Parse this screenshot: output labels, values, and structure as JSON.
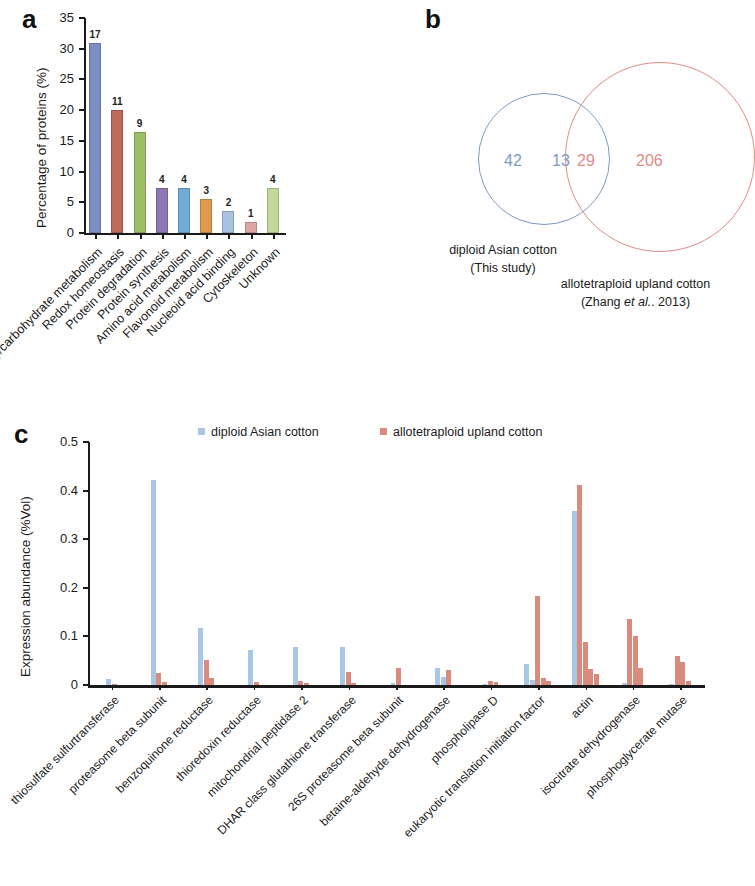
{
  "figure": {
    "panel_a_letter": "a",
    "panel_b_letter": "b",
    "panel_c_letter": "c"
  },
  "panel_a": {
    "ylabel": "Percentage of proteins (%)",
    "chart_data": {
      "type": "bar",
      "title": "",
      "xlabel": "",
      "ylabel": "Percentage of proteins (%)",
      "ylim": [
        0,
        35
      ],
      "yticks": [
        0,
        5,
        10,
        15,
        20,
        25,
        30,
        35
      ],
      "grid": false,
      "legend": "none",
      "categories": [
        "Energy/carbohydrate metabolism",
        "Redox homeostasis",
        "Protein degradation",
        "Protein synthesis",
        "Amino acid metabolism",
        "Flavonoid metabolism",
        "Nucleoid acid binding",
        "Cytoskeleton",
        "Unknown"
      ],
      "values": [
        30.9,
        20.0,
        16.4,
        7.3,
        7.3,
        5.5,
        3.6,
        1.8,
        7.3
      ],
      "counts": [
        17,
        11,
        9,
        4,
        4,
        3,
        2,
        1,
        4
      ],
      "bar_colors": [
        "#7b8fc4",
        "#bf6b5c",
        "#9cbd6a",
        "#8d77b5",
        "#6fabd4",
        "#e09a4e",
        "#a9c2e0",
        "#dda6a6",
        "#c2d99a"
      ]
    }
  },
  "panel_b": {
    "chart_data": {
      "type": "venn",
      "left_only": "42",
      "overlap_left": "13",
      "overlap_right": "29",
      "right_only": "206",
      "left_color": "#7b9ac4",
      "right_color": "#e08b82"
    },
    "left_caption_line1": "diploid Asian cotton",
    "left_caption_line2": "(This study)",
    "right_caption_line1": "allotetraploid upland cotton",
    "right_caption_line2_pre": "(Zhang ",
    "right_caption_line2_em": "et al.",
    "right_caption_line2_post": ". 2013)"
  },
  "panel_c": {
    "ylabel": "Expression abundance (%Vol)",
    "legend": [
      {
        "label": "diploid Asian cotton",
        "color": "#a8c6e6"
      },
      {
        "label": "allotetraploid upland cotton",
        "color": "#d98b7e"
      }
    ],
    "chart_data": {
      "type": "bar",
      "title": "",
      "xlabel": "",
      "ylabel": "Expression abundance (%Vol)",
      "ylim": [
        0,
        0.5
      ],
      "yticks": [
        "0",
        "0.1",
        "0.2",
        "0.3",
        "0.4",
        "0.5"
      ],
      "ytick_values": [
        0,
        0.1,
        0.2,
        0.3,
        0.4,
        0.5
      ],
      "grid": false,
      "legend_position": "top-center",
      "categories": [
        "thiosulfate sulfurtransferase",
        "proteasome beta subunit",
        "benzoquinone reductase",
        "thioredoxin reductase",
        "mitochondrial peptidase 2",
        "DHAR class glutathione transferase",
        "26S proteasome beta subunit",
        "betaine-aldehyde dehydrogenase",
        "phospholipase D",
        "eukaryotic translation initiation factor",
        "actin",
        "isocitrate dehydrogenase",
        "phosphoglycerate mutase"
      ],
      "series": [
        {
          "name": "diploid Asian cotton",
          "color": "#a8c6e6",
          "groups": [
            [
              0.012
            ],
            [
              0.422
            ],
            [
              0.118
            ],
            [
              0.072
            ],
            [
              0.078
            ],
            [
              0.079
            ],
            [
              0.005
            ],
            [
              0.035,
              0.016
            ],
            [
              0.002
            ],
            [
              0.043,
              0.01
            ],
            [
              0.357
            ],
            [
              0.004
            ],
            [
              0.003
            ]
          ]
        },
        {
          "name": "allotetraploid upland cotton",
          "color": "#d98b7e",
          "groups": [
            [
              0.002
            ],
            [
              0.025,
              0.006
            ],
            [
              0.052,
              0.014
            ],
            [
              0.006
            ],
            [
              0.008,
              0.004
            ],
            [
              0.027,
              0.004
            ],
            [
              0.034
            ],
            [
              0.031
            ],
            [
              0.009,
              0.006
            ],
            [
              0.184,
              0.015,
              0.009
            ],
            [
              0.412,
              0.088,
              0.032,
              0.022
            ],
            [
              0.135,
              0.101,
              0.035
            ],
            [
              0.06,
              0.048,
              0.008
            ]
          ]
        }
      ]
    }
  }
}
